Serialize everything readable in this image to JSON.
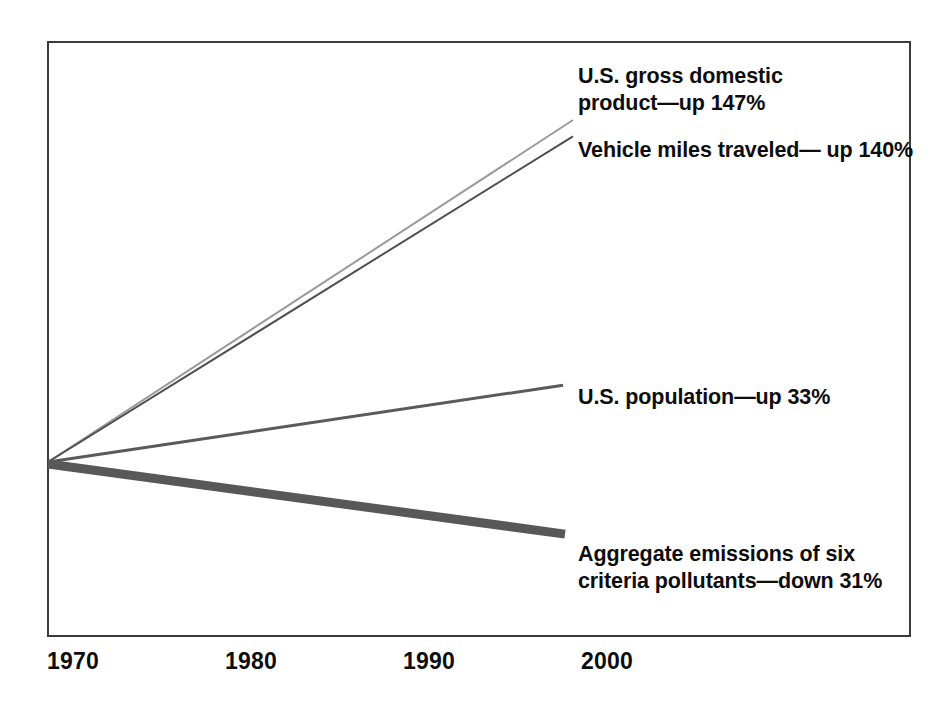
{
  "chart_data": {
    "type": "line",
    "title": "",
    "subtitle": "",
    "xlabel": "",
    "ylabel": "",
    "xlim": [
      1970,
      2000
    ],
    "ylim": [
      -40,
      160
    ],
    "grid": false,
    "legend_position": "inline-right-annotations",
    "x_ticks": [
      "1970",
      "1980",
      "1990",
      "2000"
    ],
    "x": [
      1970,
      2000
    ],
    "note": "Indexed percent change from 1970 baseline; every series starts at 0% in 1970.",
    "series": [
      {
        "name": "U.S. gross domestic product",
        "label": "U.S. gross domestic\nproduct—up 147%",
        "change_percent": 147,
        "direction": "up",
        "values": [
          0,
          147
        ],
        "color": "#9a9a9a",
        "line_width": 2
      },
      {
        "name": "Vehicle miles traveled",
        "label": "Vehicle miles traveled— up 140%",
        "change_percent": 140,
        "direction": "up",
        "values": [
          0,
          140
        ],
        "color": "#4f4f4f",
        "line_width": 2
      },
      {
        "name": "U.S. population",
        "label": "U.S. population—up 33%",
        "change_percent": 33,
        "direction": "up",
        "values": [
          0,
          33
        ],
        "color": "#5a5a5a",
        "line_width": 3
      },
      {
        "name": "Aggregate emissions of six criteria pollutants",
        "label": "Aggregate emissions of six\ncriteria pollutants—down 31%",
        "change_percent": -31,
        "direction": "down",
        "values": [
          0,
          -31
        ],
        "color": "#585858",
        "line_width": 9
      }
    ]
  },
  "axis": {
    "ticks": [
      {
        "label": "1970",
        "x_px": 47
      },
      {
        "label": "1980",
        "x_px": 225
      },
      {
        "label": "1990",
        "x_px": 403
      },
      {
        "label": "2000",
        "x_px": 581
      }
    ]
  },
  "frame": {
    "border_color": "#3b3b3b",
    "background": "#ffffff"
  }
}
